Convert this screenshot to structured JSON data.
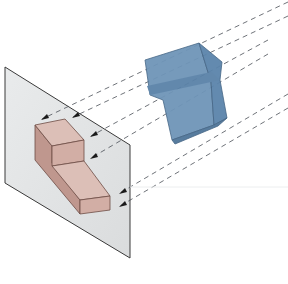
{
  "figure": {
    "colors": {
      "background": "#ffffff",
      "plane_fill": "#e2e4e5",
      "plane_edge": "#3a3a3a",
      "object_front": "#6f95b8",
      "object_side": "#5b84ab",
      "object_top": "#86a9c9",
      "object_edge": "#3e5f80",
      "projection_top": "#dcbfb7",
      "projection_front": "#d2aea5",
      "projection_side": "#bf978e",
      "projection_edge": "#6d4c45",
      "projector_line": "#4a4f57",
      "arrowhead": "#1a1a1a"
    },
    "elements": {
      "plane": "projection-plane",
      "object": "3d-object",
      "projection": "projected-view",
      "projectors": "parallel-projection-lines"
    },
    "projector_count": 6
  }
}
